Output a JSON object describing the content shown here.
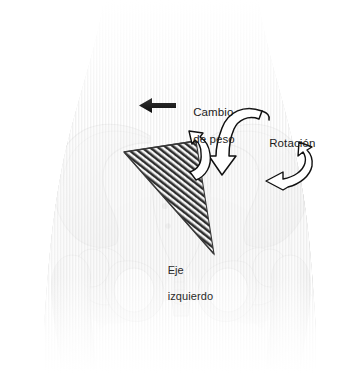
{
  "figure": {
    "kind": "anatomical-illustration",
    "language": "es",
    "background_color": "#ffffff",
    "ink_color": "#1c1c1c",
    "body_tint": "#c9c9c9",
    "bone_tint": "#e6e6e6",
    "arrow_fill_white": "#ffffff",
    "arrow_fill_black": "#111111",
    "hatch_color": "#2b2b2b",
    "width": 360,
    "height": 373
  },
  "annotations": {
    "weight_shift": {
      "label_line1": "Cambio",
      "label_line2": "de peso",
      "icon": "left-arrow-icon",
      "direction": "left"
    },
    "rotation": {
      "label": "Rotación",
      "icon": "curved-down-arrow-icon",
      "direction": "down-curving"
    },
    "left_axis": {
      "label_line1": "Eje",
      "label_line2": "izquierdo",
      "icon": "hatched-plane-icon"
    },
    "hip_rotation": {
      "icon": "curved-hook-arrow-icon",
      "direction": "counter-clockwise"
    },
    "pelvic_rotation": {
      "icon": "small-curved-hook-arrow-icon",
      "direction": "up-left"
    }
  },
  "anatomy": {
    "parts": [
      "torso-silhouette",
      "left-ilium",
      "right-ilium",
      "sacrum",
      "coccyx",
      "left-obturator-foramen",
      "right-obturator-foramen",
      "left-femur-head",
      "right-femur-head",
      "left-femur-shaft",
      "right-femur-shaft",
      "pubic-symphysis"
    ]
  }
}
